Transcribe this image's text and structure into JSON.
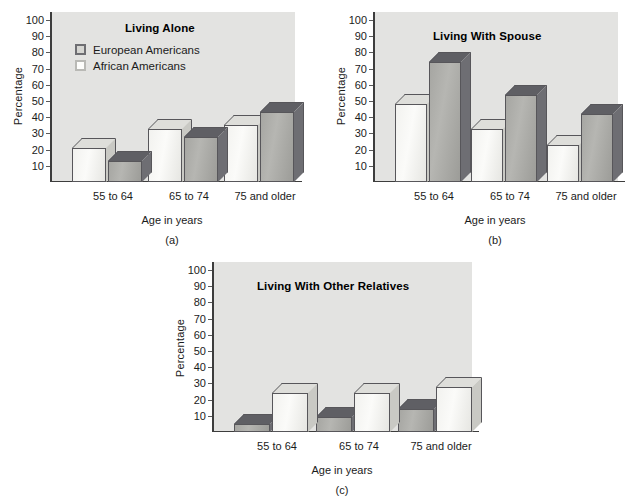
{
  "figure": {
    "axis_title_y": "Percentage",
    "axis_title_x": "Age in years",
    "tick_labels": [
      "100",
      "90",
      "80",
      "70",
      "60",
      "50",
      "40",
      "30",
      "20",
      "10"
    ],
    "categories": [
      "55 to 64",
      "65 to 74",
      "75 and older"
    ],
    "legend": [
      {
        "label": "European Americans",
        "swatch": "dark-swatch-icon"
      },
      {
        "label": "African Americans",
        "swatch": "light-swatch-icon"
      }
    ],
    "colors": {
      "plot_background": "#e3e3e1",
      "light_bar_face": "#fbfbf9",
      "light_bar_top": "#dedeta",
      "dark_bar_face": "#b6b6b2",
      "dark_bar_top": "#616166",
      "axis": "#3d3d3d",
      "text": "#1b1b1b"
    },
    "panels": [
      {
        "caption": "(a)",
        "title": "Living Alone"
      },
      {
        "caption": "(b)",
        "title": "Living With Spouse"
      },
      {
        "caption": "(c)",
        "title": "Living With Other Relatives"
      }
    ]
  },
  "chart_data": [
    {
      "type": "bar",
      "title": "Living Alone",
      "caption": "(a)",
      "xlabel": "Age in years",
      "ylabel": "Percentage",
      "ylim": [
        0,
        100
      ],
      "yticks": [
        10,
        20,
        30,
        40,
        50,
        60,
        70,
        80,
        90,
        100
      ],
      "grid": false,
      "legend_position": "upper-left-inside",
      "categories": [
        "55 to 64",
        "65 to 74",
        "75 and older"
      ],
      "series": [
        {
          "name": "African Americans",
          "values": [
            21,
            33,
            35
          ]
        },
        {
          "name": "European Americans",
          "values": [
            13,
            28,
            43
          ]
        }
      ],
      "series_draw_order": [
        "African Americans",
        "European Americans"
      ]
    },
    {
      "type": "bar",
      "title": "Living With Spouse",
      "caption": "(b)",
      "xlabel": "Age in years",
      "ylabel": "Percentage",
      "ylim": [
        0,
        100
      ],
      "yticks": [
        10,
        20,
        30,
        40,
        50,
        60,
        70,
        80,
        90,
        100
      ],
      "grid": false,
      "legend_position": "none",
      "categories": [
        "55 to 64",
        "65 to 74",
        "75 and older"
      ],
      "series": [
        {
          "name": "African Americans",
          "values": [
            48,
            33,
            23
          ]
        },
        {
          "name": "European Americans",
          "values": [
            74,
            54,
            42
          ]
        }
      ],
      "series_draw_order": [
        "African Americans",
        "European Americans"
      ]
    },
    {
      "type": "bar",
      "title": "Living With Other Relatives",
      "caption": "(c)",
      "xlabel": "Age in years",
      "ylabel": "Percentage",
      "ylim": [
        0,
        100
      ],
      "yticks": [
        10,
        20,
        30,
        40,
        50,
        60,
        70,
        80,
        90,
        100
      ],
      "grid": false,
      "legend_position": "none",
      "categories": [
        "55 to 64",
        "65 to 74",
        "75 and older"
      ],
      "series": [
        {
          "name": "European Americans",
          "values": [
            5,
            9,
            14
          ]
        },
        {
          "name": "African Americans",
          "values": [
            24,
            24,
            28
          ]
        }
      ],
      "series_draw_order": [
        "European Americans",
        "African Americans"
      ]
    }
  ]
}
